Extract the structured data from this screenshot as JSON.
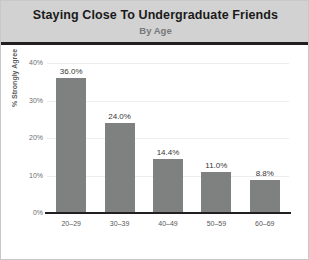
{
  "header": {
    "title": "Staying Close To Undergraduate Friends",
    "subtitle": "By Age"
  },
  "chart_data": {
    "type": "bar",
    "title": "Staying Close To Undergraduate Friends",
    "subtitle": "By Age",
    "categories": [
      "20–29",
      "30–39",
      "40–49",
      "50–59",
      "60–69"
    ],
    "values": [
      36.0,
      24.0,
      14.4,
      11.0,
      8.8
    ],
    "value_labels": [
      "36.0%",
      "24.0%",
      "14.4%",
      "11.0%",
      "8.8%"
    ],
    "xlabel": "",
    "ylabel": "% Strongly Agree",
    "ylim": [
      0,
      40
    ],
    "ytick_labels": [
      "40%",
      "30%",
      "20%",
      "10%",
      "0%"
    ],
    "ytick_values": [
      40,
      30,
      20,
      10,
      0
    ],
    "grid": true,
    "legend": "none",
    "bar_color": "#7f8080",
    "header_background": "#d2d2d2",
    "plot_background": "#ffffff",
    "gridline_color": "#ededed",
    "axis_color": "#231f20"
  }
}
